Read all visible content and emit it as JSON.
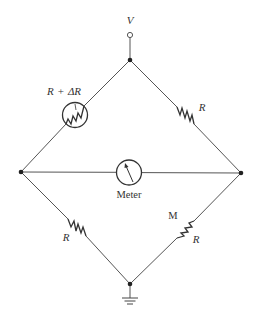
{
  "diagram": {
    "type": "wheatstone-bridge-circuit",
    "supply": {
      "label": "V"
    },
    "components": [
      {
        "id": "thermistor",
        "position": "top-left",
        "label_main": "R",
        "label_op": "+",
        "label_delta": "ΔR"
      },
      {
        "id": "resistor-top-right",
        "position": "top-right",
        "label": "R"
      },
      {
        "id": "meter",
        "position": "center",
        "label": "Meter"
      },
      {
        "id": "resistor-bottom-left",
        "position": "bottom-left",
        "label": "R"
      },
      {
        "id": "resistor-bottom-right",
        "position": "bottom-right",
        "label_extra": "M",
        "label": "R"
      }
    ],
    "ground": {
      "position": "bottom"
    }
  }
}
